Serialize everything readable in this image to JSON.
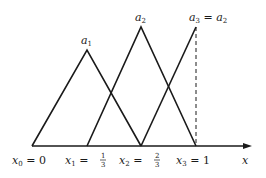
{
  "diagram": {
    "axis_label": "x",
    "peak_labels": {
      "a1": "a",
      "a1_sub": "1",
      "a2": "a",
      "a2_sub": "2",
      "a3": "a",
      "a3_sub": "3",
      "a3_eq": " = ",
      "a3_rhs": "a",
      "a3_rhs_sub": "2"
    },
    "ticks": [
      {
        "var": "x",
        "sub": "0",
        "eq": " = ",
        "value": "0"
      },
      {
        "var": "x",
        "sub": "1",
        "eq": " = ",
        "num": "1",
        "den": "3"
      },
      {
        "var": "x",
        "sub": "2",
        "eq": " = ",
        "num": "2",
        "den": "3"
      },
      {
        "var": "x",
        "sub": "3",
        "eq": " = ",
        "value": "1"
      }
    ],
    "stroke_color": "#1a1a1a"
  }
}
